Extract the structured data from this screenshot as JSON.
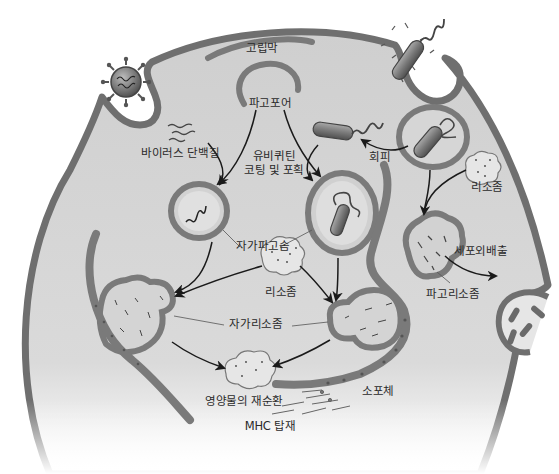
{
  "diagram": {
    "colors": {
      "background": "#ffffff",
      "cytoplasm": "#d4d4d4",
      "membrane": "#7a7a7a",
      "membrane_dark": "#555555",
      "vesicle_fill": "#cfcfcf",
      "lysosome_fill": "#e2e2e2",
      "bacterium": "#6e6e6e",
      "text": "#2a2a2a",
      "arrow": "#1a1a1a"
    },
    "labels": {
      "golgi": "고립막",
      "phagophore": "파고포어",
      "viral_protein": "바이러스 단백질",
      "ubiquitin_line1": "유비퀴틴",
      "ubiquitin_line2": "코팅 및 포획",
      "escape": "회피",
      "lysosome_right": "리소좀",
      "autophagosome": "자가파고솜",
      "lysosome_center": "리소좀",
      "exocytosis": "세포외배출",
      "phagolysosome": "파고리소좀",
      "autolysosome": "자가리소좀",
      "nutrient_recycling": "영양물의 재순환",
      "endoplasmic_reticulum": "소포체",
      "mhc_loading": "MHC 탑재"
    },
    "elements": [
      {
        "name": "cell",
        "type": "cell-body"
      },
      {
        "name": "virus",
        "type": "virus-particle",
        "location": "entering cell top-left"
      },
      {
        "name": "bacterium-entering",
        "type": "bacterium",
        "location": "top-right phagocytic cup"
      },
      {
        "name": "isolation-membrane",
        "type": "membrane-arc"
      },
      {
        "name": "phagophore",
        "type": "membrane-arc"
      },
      {
        "name": "viral-protein-strands",
        "type": "protein"
      },
      {
        "name": "free-bacterium",
        "type": "bacterium",
        "location": "cytoplasm"
      },
      {
        "name": "phagosome-with-bacterium",
        "type": "vesicle"
      },
      {
        "name": "autophagosome-viral",
        "type": "vesicle"
      },
      {
        "name": "autophagosome-bacterial",
        "type": "vesicle"
      },
      {
        "name": "lysosome-center",
        "type": "lysosome"
      },
      {
        "name": "lysosome-right",
        "type": "lysosome"
      },
      {
        "name": "phagolysosome",
        "type": "vesicle"
      },
      {
        "name": "exocytosis-vesicle",
        "type": "vesicle"
      },
      {
        "name": "autolysosome-left",
        "type": "vesicle"
      },
      {
        "name": "autolysosome-right",
        "type": "vesicle"
      },
      {
        "name": "recycled-nutrients",
        "type": "granule"
      },
      {
        "name": "endoplasmic-reticulum-left",
        "type": "organelle"
      },
      {
        "name": "endoplasmic-reticulum-right",
        "type": "organelle"
      },
      {
        "name": "mhc-peptides",
        "type": "peptides"
      }
    ]
  }
}
